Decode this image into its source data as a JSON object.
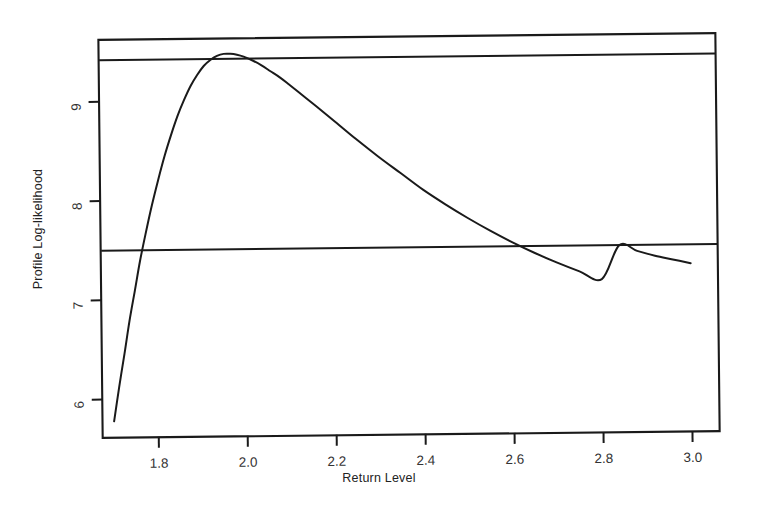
{
  "chart_data": {
    "type": "line",
    "title": "",
    "xlabel": "Return Level",
    "ylabel": "Profile Log-likelihood",
    "xlim": [
      1.675,
      3.06
    ],
    "ylim": [
      5.62,
      9.62
    ],
    "grid": false,
    "legend": null,
    "xticks": [
      1.8,
      2.0,
      2.2,
      2.4,
      2.6,
      2.8,
      3.0
    ],
    "xticklabels": [
      "1.8",
      "2.0",
      "2.2",
      "2.4",
      "2.6",
      "2.8",
      "3.0"
    ],
    "yticks": [
      6,
      7,
      8,
      9
    ],
    "yticklabels": [
      "6",
      "7",
      "8",
      "9"
    ],
    "series": [
      {
        "name": "profile-log-likelihood",
        "type": "line",
        "color": "#1a1a1a",
        "x": [
          1.7,
          1.712,
          1.725,
          1.737,
          1.75,
          1.762,
          1.775,
          1.79,
          1.805,
          1.82,
          1.835,
          1.85,
          1.865,
          1.88,
          1.895,
          1.91,
          1.925,
          1.94,
          1.955,
          1.97,
          1.985,
          2.0,
          2.02,
          2.04,
          2.06,
          2.08,
          2.1,
          2.13,
          2.16,
          2.2,
          2.25,
          2.3,
          2.35,
          2.4,
          2.45,
          2.5,
          2.55,
          2.6,
          2.65,
          2.7,
          2.75,
          2.8,
          2.84,
          2.88,
          2.92,
          2.96,
          3.0
        ],
        "y": [
          5.78,
          6.12,
          6.46,
          6.79,
          7.1,
          7.39,
          7.66,
          7.95,
          8.21,
          8.45,
          8.66,
          8.85,
          9.01,
          9.15,
          9.26,
          9.35,
          9.41,
          9.45,
          9.47,
          9.47,
          9.46,
          9.44,
          9.4,
          9.35,
          9.29,
          9.23,
          9.16,
          9.05,
          8.94,
          8.79,
          8.6,
          8.42,
          8.25,
          8.08,
          7.93,
          7.79,
          7.66,
          7.54,
          7.43,
          7.33,
          7.24,
          7.16,
          7.5,
          7.44,
          7.39,
          7.35,
          7.31
        ]
      },
      {
        "name": "upper-reference-line",
        "type": "hline",
        "color": "#1a1a1a",
        "y": 9.42
      },
      {
        "name": "confidence-interval-line",
        "type": "hline",
        "color": "#1a1a1a",
        "y": 7.5
      }
    ],
    "annotations": []
  },
  "figure": {
    "x_axis_title": "Return Level",
    "y_axis_title": "Profile Log-likelihood",
    "axis_color": "#1a1a1a",
    "tick_label_color": "#333333",
    "background": "#ffffff"
  }
}
